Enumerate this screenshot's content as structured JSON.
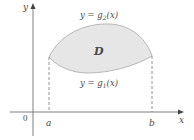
{
  "diagram": {
    "axes": {
      "x_label": "x",
      "y_label": "y",
      "origin_label": "0"
    },
    "bounds": {
      "left_label": "a",
      "right_label": "b"
    },
    "region": {
      "label": "D",
      "fill_color": "#e6e6e6",
      "edge_color": "#b0b0b0"
    },
    "curves": {
      "upper_label": "y = g",
      "upper_sub": "2",
      "upper_arg": "(x)",
      "lower_label": "y = g",
      "lower_sub": "1",
      "lower_arg": "(x)"
    },
    "colors": {
      "axis": "#6f6f6f",
      "text": "#4a4a4a",
      "dashed": "#7a7a7a"
    }
  }
}
